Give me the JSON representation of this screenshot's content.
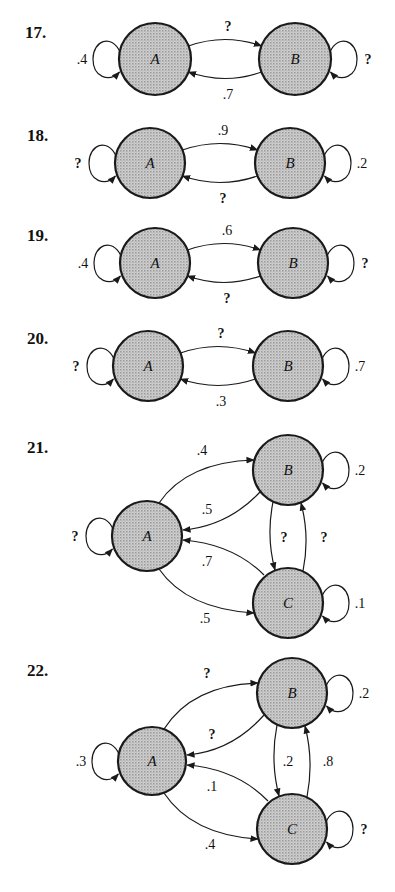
{
  "colors": {
    "node_fill": "#bdbdbd",
    "stroke": "#1a1a1a",
    "background": "#ffffff"
  },
  "problems": [
    {
      "number": "17.",
      "label_pos": [
        25,
        38
      ],
      "nodes": [
        {
          "id": "A",
          "label": "A",
          "cx": 155,
          "cy": 59,
          "r": 36
        },
        {
          "id": "B",
          "label": "B",
          "cx": 295,
          "cy": 59,
          "r": 36
        }
      ],
      "edges": [
        {
          "from": "A",
          "to": "A",
          "label": "?"
        },
        {
          "from": "A",
          "to": "B",
          "label": "?"
        },
        {
          "from": "B",
          "to": "A",
          "label": ".7"
        },
        {
          "from": "B",
          "to": "B",
          "label": "?"
        }
      ],
      "self_loops": {
        "A": ".4",
        "B": "?"
      },
      "AB": "?",
      "BA": ".7"
    },
    {
      "number": "18.",
      "label_pos": [
        27,
        141
      ],
      "nodes": [
        {
          "id": "A",
          "label": "A",
          "cx": 150,
          "cy": 163,
          "r": 35
        },
        {
          "id": "B",
          "label": "B",
          "cx": 290,
          "cy": 163,
          "r": 35
        }
      ],
      "self_loops": {
        "A": "?",
        "B": ".2"
      },
      "AB": ".9",
      "BA": "?"
    },
    {
      "number": "19.",
      "label_pos": [
        27,
        241
      ],
      "nodes": [
        {
          "id": "A",
          "label": "A",
          "cx": 155,
          "cy": 263,
          "r": 35
        },
        {
          "id": "B",
          "label": "B",
          "cx": 293,
          "cy": 263,
          "r": 35
        }
      ],
      "self_loops": {
        "A": ".4",
        "B": "?"
      },
      "AB": ".6",
      "BA": "?"
    },
    {
      "number": "20.",
      "label_pos": [
        27,
        344
      ],
      "nodes": [
        {
          "id": "A",
          "label": "A",
          "cx": 148,
          "cy": 366,
          "r": 35
        },
        {
          "id": "B",
          "label": "B",
          "cx": 288,
          "cy": 366,
          "r": 35
        }
      ],
      "self_loops": {
        "A": "?",
        "B": ".7"
      },
      "AB": "?",
      "BA": ".3"
    },
    {
      "number": "21.",
      "label_pos": [
        27,
        453
      ],
      "nodes": [
        {
          "id": "A",
          "label": "A",
          "cx": 147,
          "cy": 536,
          "r": 35
        },
        {
          "id": "B",
          "label": "B",
          "cx": 288,
          "cy": 470,
          "r": 35
        },
        {
          "id": "C",
          "label": "C",
          "cx": 288,
          "cy": 603,
          "r": 35
        }
      ],
      "self_loops": {
        "A": "?",
        "B": ".2",
        "C": ".1"
      },
      "AB": ".4",
      "BA": ".5",
      "CA": ".7",
      "AC": ".5",
      "BC": "?",
      "CB": "?"
    },
    {
      "number": "22.",
      "label_pos": [
        27,
        676
      ],
      "nodes": [
        {
          "id": "A",
          "label": "A",
          "cx": 152,
          "cy": 761,
          "r": 34
        },
        {
          "id": "B",
          "label": "B",
          "cx": 292,
          "cy": 693,
          "r": 35
        },
        {
          "id": "C",
          "label": "C",
          "cx": 292,
          "cy": 829,
          "r": 35
        }
      ],
      "self_loops": {
        "A": ".3",
        "B": ".2",
        "C": "?"
      },
      "AB": "?",
      "BA": "?",
      "CA": ".1",
      "AC": ".4",
      "BC": ".2",
      "CB": ".8"
    }
  ]
}
